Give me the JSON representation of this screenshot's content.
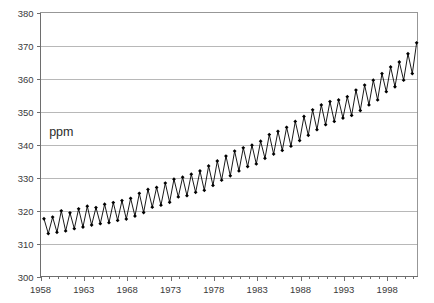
{
  "chart_data": {
    "type": "line",
    "title": "",
    "subtitle": "",
    "xlabel": "",
    "ylabel": "ppm",
    "ylabel_position": "inside-plot",
    "grid": "horizontal",
    "legend": "none",
    "marker": "filled-diamond",
    "line_color": "#000000",
    "grid_color": "#9a9a9a",
    "axis_color": "#6e6e6e",
    "background_color": "#ffffff",
    "xlim": [
      1958,
      2001.5
    ],
    "ylim": [
      300,
      380
    ],
    "y_ticks": [
      300,
      310,
      320,
      330,
      340,
      350,
      360,
      370,
      380
    ],
    "y_tick_labels": [
      "300",
      "310",
      "320",
      "330",
      "340",
      "350",
      "360",
      "370",
      "380"
    ],
    "x_ticks": [
      1958,
      1963,
      1968,
      1973,
      1978,
      1983,
      1988,
      1993,
      1998
    ],
    "x_tick_labels": [
      "1958",
      "1963",
      "1968",
      "1973",
      "1978",
      "1983",
      "1988",
      "1993",
      "1998"
    ],
    "x_minor_interval": 1,
    "series": [
      {
        "name": "Atmospheric CO2 concentration",
        "units": "ppm",
        "x": [
          1958.4,
          1958.9,
          1959.4,
          1959.9,
          1960.4,
          1960.9,
          1961.4,
          1961.9,
          1962.4,
          1962.9,
          1963.4,
          1963.9,
          1964.4,
          1964.9,
          1965.4,
          1965.9,
          1966.4,
          1966.9,
          1967.4,
          1967.9,
          1968.4,
          1968.9,
          1969.4,
          1969.9,
          1970.4,
          1970.9,
          1971.4,
          1971.9,
          1972.4,
          1972.9,
          1973.4,
          1973.9,
          1974.4,
          1974.9,
          1975.4,
          1975.9,
          1976.4,
          1976.9,
          1977.4,
          1977.9,
          1978.4,
          1978.9,
          1979.4,
          1979.9,
          1980.4,
          1980.9,
          1981.4,
          1981.9,
          1982.4,
          1982.9,
          1983.4,
          1983.9,
          1984.4,
          1984.9,
          1985.4,
          1985.9,
          1986.4,
          1986.9,
          1987.4,
          1987.9,
          1988.4,
          1988.9,
          1989.4,
          1989.9,
          1990.4,
          1990.9,
          1991.4,
          1991.9,
          1992.4,
          1992.9,
          1993.4,
          1993.9,
          1994.4,
          1994.9,
          1995.4,
          1995.9,
          1996.4,
          1996.9,
          1997.4,
          1997.9,
          1998.4,
          1998.9,
          1999.4,
          1999.9,
          2000.4,
          2000.9,
          2001.4
        ],
        "y": [
          317.5,
          313.0,
          318.0,
          313.4,
          319.9,
          313.8,
          319.3,
          314.5,
          320.5,
          315.0,
          321.3,
          315.6,
          320.9,
          316.0,
          321.9,
          316.3,
          322.4,
          317.0,
          323.0,
          317.4,
          323.7,
          318.3,
          325.2,
          319.4,
          326.4,
          321.0,
          327.0,
          321.6,
          328.3,
          322.5,
          329.5,
          324.1,
          330.1,
          324.5,
          331.0,
          325.5,
          332.0,
          326.1,
          333.5,
          327.6,
          335.0,
          329.2,
          336.5,
          330.5,
          338.0,
          332.0,
          339.0,
          333.3,
          339.8,
          334.1,
          341.0,
          335.8,
          343.0,
          337.1,
          344.0,
          338.2,
          345.2,
          339.5,
          347.0,
          341.2,
          348.5,
          342.8,
          350.5,
          344.5,
          352.0,
          346.0,
          353.0,
          347.0,
          353.5,
          348.0,
          354.5,
          348.8,
          356.5,
          350.3,
          358.0,
          352.0,
          359.5,
          353.5,
          361.5,
          356.0,
          363.5,
          357.5,
          365.0,
          359.5,
          367.5,
          361.5,
          370.8
        ],
        "final_value": 366.8,
        "max_value": 370.8,
        "min_value": 313.0,
        "start_value": 317.5
      }
    ],
    "annotations": [
      {
        "text": "ppm",
        "x": 1959.0,
        "y": 342.5
      }
    ]
  },
  "axes": {
    "y_axis_name": "concentration-axis",
    "x_axis_name": "year-axis"
  }
}
